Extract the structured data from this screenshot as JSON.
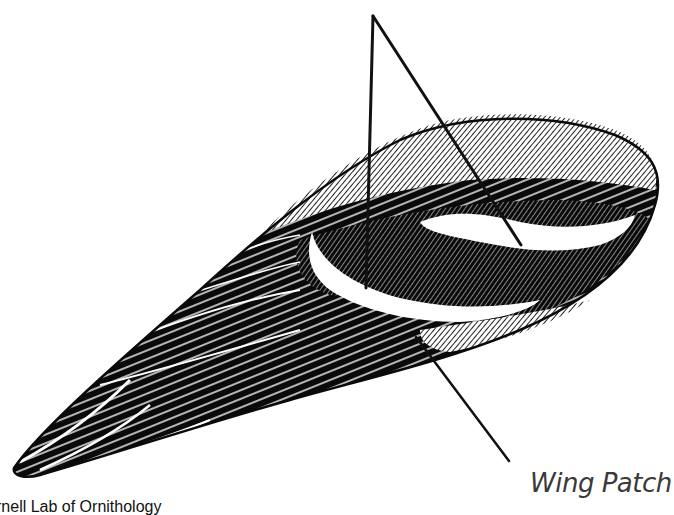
{
  "illustration": {
    "subject": "bird wing line illustration",
    "colors": {
      "ink": "#0a0a0a",
      "paper": "#ffffff",
      "label": "#3a3a3a"
    }
  },
  "labels": {
    "wing_patch": "Wing Patch"
  },
  "credit": {
    "text": "rnell Lab of Ornithology"
  }
}
